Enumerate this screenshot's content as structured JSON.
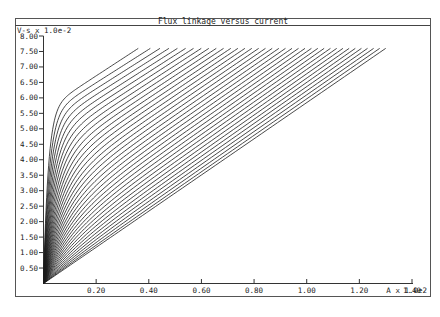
{
  "chart_data": {
    "type": "line",
    "title": "Flux linkage versus current",
    "ylabel": "V-s x 1.0e-2",
    "xlabel": "A x 1.0e2",
    "xlim": [
      0,
      1.4
    ],
    "ylim": [
      0,
      8.0
    ],
    "x_ticks": [
      "0.20",
      "0.40",
      "0.60",
      "0.80",
      "1.00",
      "1.20",
      "1.40"
    ],
    "y_ticks": [
      "0.50",
      "1.00",
      "1.50",
      "2.00",
      "2.50",
      "3.00",
      "3.50",
      "4.00",
      "4.50",
      "5.00",
      "5.50",
      "6.00",
      "6.50",
      "7.00",
      "7.50",
      "8.00"
    ],
    "grid": false,
    "legend": "none",
    "series_description": "Family of about 36 magnetization curves (one per rotor position), all starting at origin and ending at flux linkage 7.60; the aligned curve saturates sharply near 5.5 at ~0.05 and ends at ~0.36, intermediate curves progressively less saturated, the unaligned curve is a straight line from origin to (1.30, 7.60).",
    "series_count": 36,
    "end_flux": 7.6,
    "aligned_end_current": 0.36,
    "unaligned_end_current": 1.3,
    "aligned_knee": [
      0.05,
      5.5
    ],
    "sample_series": [
      {
        "name": "aligned",
        "x": [
          0,
          0.02,
          0.04,
          0.06,
          0.1,
          0.2,
          0.3,
          0.36
        ],
        "y": [
          0,
          3.2,
          5.0,
          5.7,
          6.2,
          6.9,
          7.4,
          7.6
        ]
      },
      {
        "name": "mid",
        "x": [
          0,
          0.1,
          0.2,
          0.4,
          0.6,
          0.8
        ],
        "y": [
          0,
          2.6,
          4.1,
          5.6,
          6.7,
          7.6
        ]
      },
      {
        "name": "unaligned",
        "x": [
          0,
          0.65,
          1.3
        ],
        "y": [
          0,
          3.8,
          7.6
        ]
      }
    ]
  },
  "window": {
    "title": "Flux linkage versus current",
    "y_unit": "V-s x 1.0e-2",
    "x_unit": "A x 1.0e2"
  }
}
